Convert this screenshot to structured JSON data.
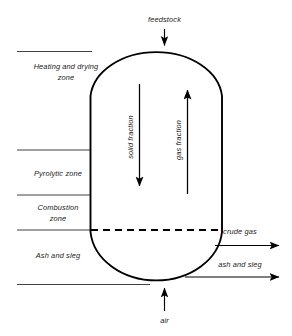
{
  "diagram": {
    "colors": {
      "outline": "#000000",
      "zone_line": "#2b2b2b",
      "text": "#1a1a1a",
      "background": "#ffffff"
    },
    "inputs": [
      {
        "id": "feedstock",
        "label": "feedstock",
        "position": "top"
      },
      {
        "id": "air",
        "label": "air",
        "position": "bottom"
      }
    ],
    "outputs": [
      {
        "id": "crude-gas",
        "label": "crude gas",
        "position": "right-upper"
      },
      {
        "id": "ash-and-sleg",
        "label": "ash and sleg",
        "position": "right-lower"
      }
    ],
    "zones": [
      {
        "id": "heating-drying",
        "line1": "Heating and drying",
        "line2": "zone"
      },
      {
        "id": "pyrolytic",
        "line1": "Pyrolytic zone",
        "line2": ""
      },
      {
        "id": "combustion",
        "line1": "Combustion",
        "line2": "zone"
      },
      {
        "id": "ash-slag",
        "line1": "Ash and sleg",
        "line2": ""
      }
    ],
    "internal_flows": [
      {
        "id": "solid-fraction",
        "label": "solid fraction",
        "direction": "down"
      },
      {
        "id": "gas-fraction",
        "label": "gas fraction",
        "direction": "up"
      }
    ]
  }
}
